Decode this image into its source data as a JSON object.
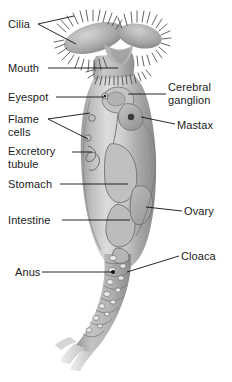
{
  "figure": {
    "organism": "rotifer",
    "orientation": "vertical, head (corona) at top, foot with toes at bottom",
    "style": "grayscale shaded 3D illustration with black leader lines and black sans-serif labels on white background",
    "colors": {
      "background": "#ffffff",
      "label_text": "#1a1a1a",
      "leader_line": "#111111",
      "body_light": "#d2d2d2",
      "body_mid": "#b0b0b0",
      "body_dark": "#8a8a8a",
      "body_shadow": "#6e6e6e",
      "organ_outline": "#6a6a6a",
      "cilia": "#3a3a3a",
      "toe_pale": "#e2e2e2",
      "dot_dark": "#1d1d1d"
    }
  },
  "labels": {
    "cilia": "Cilia",
    "mouth": "Mouth",
    "eyespot": "Eyespot",
    "flame_line1": "Flame",
    "flame_line2": "cells",
    "excretory_line1": "Excretory",
    "excretory_line2": "tubule",
    "stomach": "Stomach",
    "intestine": "Intestine",
    "anus": "Anus",
    "cerebral_line1": "Cerebral",
    "cerebral_line2": "ganglion",
    "mastax": "Mastax",
    "ovary": "Ovary",
    "cloaca": "Cloaca"
  },
  "label_list": [
    {
      "name": "cilia",
      "text": "Cilia",
      "side": "left",
      "x": 8,
      "y": 18,
      "leader": "forked, two branches to upper and lower corona cilia"
    },
    {
      "name": "mouth",
      "text": "Mouth",
      "side": "left",
      "x": 8,
      "y": 62,
      "leader": "horizontal to mouth funnel below corona"
    },
    {
      "name": "eyespot",
      "text": "Eyespot",
      "side": "left",
      "x": 8,
      "y": 91,
      "leader": "horizontal to dark eyespot on head"
    },
    {
      "name": "flame-cells",
      "text": "Flame cells",
      "side": "left",
      "x": 8,
      "y": 113,
      "leader": "forked, two branches to flame cells on body wall"
    },
    {
      "name": "excretory-tubule",
      "text": "Excretory tubule",
      "side": "left",
      "x": 8,
      "y": 145,
      "leader": "horizontal to coiled excretory tubule"
    },
    {
      "name": "stomach",
      "text": "Stomach",
      "side": "left",
      "x": 8,
      "y": 178,
      "leader": "horizontal to stomach in mid body"
    },
    {
      "name": "intestine",
      "text": "Intestine",
      "side": "left",
      "x": 8,
      "y": 214,
      "leader": "horizontal to intestine in lower body"
    },
    {
      "name": "anus",
      "text": "Anus",
      "side": "left",
      "x": 15,
      "y": 266,
      "leader": "long horizontal to dark anus dot on foot"
    },
    {
      "name": "cerebral-ganglion",
      "text": "Cerebral ganglion",
      "side": "right",
      "x": 168,
      "y": 81,
      "leader": "horizontal to cerebral ganglion behind head"
    },
    {
      "name": "mastax",
      "text": "Mastax",
      "side": "right",
      "x": 177,
      "y": 119,
      "leader": "horizontal to mastax (jaw apparatus)"
    },
    {
      "name": "ovary",
      "text": "Ovary",
      "side": "right",
      "x": 184,
      "y": 205,
      "leader": "horizontal to ovary in lower body"
    },
    {
      "name": "cloaca",
      "text": "Cloaca",
      "side": "right",
      "x": 181,
      "y": 250,
      "leader": "diagonal to cloaca at foot junction"
    }
  ],
  "anatomy_parts": [
    "corona with cilia",
    "mouth",
    "eyespot",
    "cerebral ganglion",
    "mastax",
    "flame cells",
    "excretory tubule",
    "stomach",
    "intestine",
    "ovary",
    "cloaca",
    "anus",
    "segmented foot",
    "two toes"
  ]
}
